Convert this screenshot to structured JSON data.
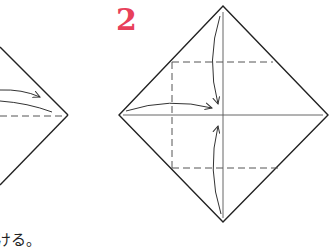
{
  "step": {
    "number": "2",
    "color": "#e8405a"
  },
  "caption": {
    "text": "ける。"
  },
  "diagram": {
    "line_color": "#222222",
    "crease_color": "#555555",
    "dash_color": "#555555"
  }
}
